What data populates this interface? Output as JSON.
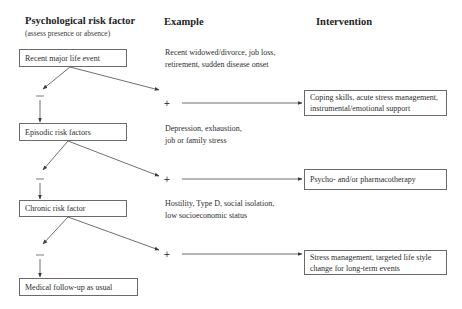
{
  "headers": {
    "risk_factor": "Psychological risk factor",
    "risk_factor_sub": "(assess presence or absence)",
    "example": "Example",
    "intervention": "Intervention"
  },
  "rows": [
    {
      "risk_factor": "Recent major life event",
      "example_line1": "Recent widowed/divorce, job loss,",
      "example_line2": "retirement, sudden disease onset",
      "intervention_line1": "Coping skills, acute stress management,",
      "intervention_line2": "instrumental/emotional support",
      "absent_sign": "−",
      "present_sign": "+"
    },
    {
      "risk_factor": "Episodic risk factors",
      "example_line1": "Depression, exhaustion,",
      "example_line2": "job or family stress",
      "intervention_line1": "Psycho- and/or pharmacotherapy",
      "intervention_line2": "",
      "absent_sign": "−",
      "present_sign": "+"
    },
    {
      "risk_factor": "Chronic risk factor",
      "example_line1": "Hostility, Type D, social isolation,",
      "example_line2": "low socioeconomic status",
      "intervention_line1": "Stress management, targeted life style",
      "intervention_line2": "change for long-term events",
      "absent_sign": "−",
      "present_sign": "+"
    }
  ],
  "final": {
    "label": "Medical follow-up as usual"
  },
  "colors": {
    "line": "#4a4a4a",
    "box_border": "#6a6a6a",
    "text": "#2e2e2e"
  }
}
